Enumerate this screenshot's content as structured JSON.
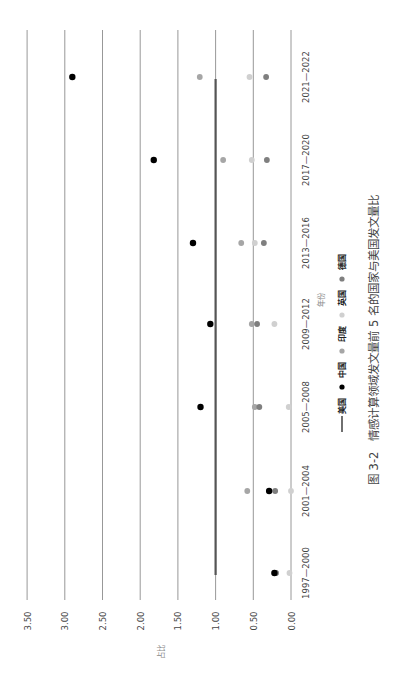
{
  "chart_data": {
    "type": "scatter",
    "orientation": "rotated-90-clockwise",
    "title": "图 3-2　情感计算领域发文量前 5 名的国家与美国发文量比",
    "xlabel": "年份",
    "ylabel": "占比",
    "ylim": [
      0,
      3.5
    ],
    "y_ticks": [
      "0.00",
      "0.50",
      "1.00",
      "1.50",
      "2.00",
      "2.50",
      "3.00",
      "3.50"
    ],
    "grid": true,
    "legend_position": "bottom",
    "categories": [
      "1997—2000",
      "2001—2004",
      "2005—2008",
      "2009—2012",
      "2013—2016",
      "2017—2020",
      "2021—2022"
    ],
    "series": [
      {
        "name": "美国",
        "style": "line",
        "color": "#555555",
        "values": [
          1.0,
          1.0,
          1.0,
          1.0,
          1.0,
          1.0,
          1.0
        ]
      },
      {
        "name": "中国",
        "style": "dot",
        "color": "#000000",
        "values": [
          0.22,
          0.29,
          1.2,
          1.07,
          1.3,
          1.82,
          2.9
        ]
      },
      {
        "name": "印度",
        "style": "dot",
        "color": "#a6a6a6",
        "values": [
          0.2,
          0.58,
          0.48,
          0.52,
          0.66,
          0.9,
          1.21
        ]
      },
      {
        "name": "英国",
        "style": "dot",
        "color": "#d0d0d0",
        "values": [
          0.02,
          0.0,
          0.03,
          0.22,
          0.48,
          0.52,
          0.55
        ]
      },
      {
        "name": "德国",
        "style": "dot",
        "color": "#7f7f7f",
        "values": [
          0.2,
          0.21,
          0.42,
          0.45,
          0.36,
          0.32,
          0.33
        ]
      }
    ]
  }
}
